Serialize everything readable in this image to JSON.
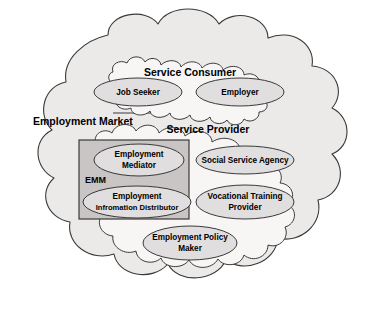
{
  "diagram": {
    "colors": {
      "outer_cloud_fill": "#eceae9",
      "inner_cloud_fill": "#f7f6f5",
      "ellipse_fill": "#e0dede",
      "group_box_fill": "#c8c5c4",
      "stroke": "#3a3a3a",
      "text": "#000000",
      "background": "#ffffff"
    },
    "outer_cloud": {
      "label": "Employment Market"
    },
    "clouds": [
      {
        "id": "service-consumer",
        "label": "Service Consumer",
        "nodes": [
          {
            "id": "job-seeker",
            "label": "Job Seeker"
          },
          {
            "id": "employer",
            "label": "Employer"
          }
        ]
      },
      {
        "id": "service-provider",
        "label": "Service Provider",
        "nodes": [
          {
            "id": "employment-mediator",
            "line1": "Employment",
            "line2": "Mediator"
          },
          {
            "id": "social-service-agency",
            "line1": "Social Service Agency",
            "line2": ""
          },
          {
            "id": "employment-information-distributor",
            "line1": "Employment",
            "line2": "Infromation Distributor"
          },
          {
            "id": "vocational-training-provider",
            "line1": "Vocational Training",
            "line2": "Provider"
          },
          {
            "id": "employment-policy-maker",
            "line1": "Employment Policy",
            "line2": "Maker"
          }
        ]
      }
    ],
    "group_box": {
      "id": "emm",
      "label": "EMM",
      "contains": [
        "employment-mediator",
        "employment-information-distributor"
      ]
    },
    "connectors": [
      {
        "id": "connector-left",
        "from": "service-consumer",
        "to": "service-provider",
        "marker": "diamond"
      },
      {
        "id": "connector-right",
        "from": "service-consumer",
        "to": "service-provider",
        "marker": "diamond"
      }
    ]
  }
}
